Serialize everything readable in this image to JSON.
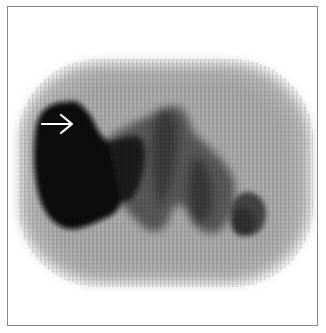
{
  "figure": {
    "type": "nuclear-medicine scintigraphy scan (grayscale)",
    "border_color": "#8a8a8a",
    "background": "#ffffff",
    "annotation": {
      "icon": "arrow-right-icon",
      "color": "#ffffff",
      "points_to": "intense uptake region, upper left"
    },
    "regions": [
      {
        "name": "body-outline",
        "tone": "light gray",
        "color": "#b4b4b4"
      },
      {
        "name": "large-hot-region-left",
        "tone": "black",
        "color": "#080808"
      },
      {
        "name": "central-band",
        "tone": "dark gray",
        "color": "#3a3a3a"
      },
      {
        "name": "right-lower-focus",
        "tone": "dark gray",
        "color": "#444444"
      }
    ]
  }
}
